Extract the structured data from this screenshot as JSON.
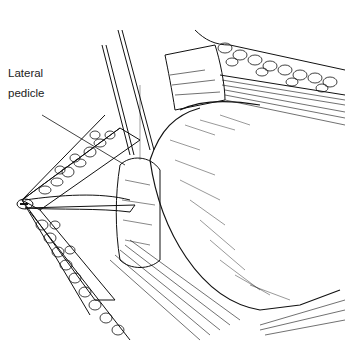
{
  "figure": {
    "type": "surgical line illustration",
    "labels": [
      {
        "id": "lateral-pedicle",
        "line1": "Lateral",
        "line2": "pedicle"
      }
    ],
    "colors": {
      "ink": "#111111",
      "background": "#ffffff"
    }
  }
}
